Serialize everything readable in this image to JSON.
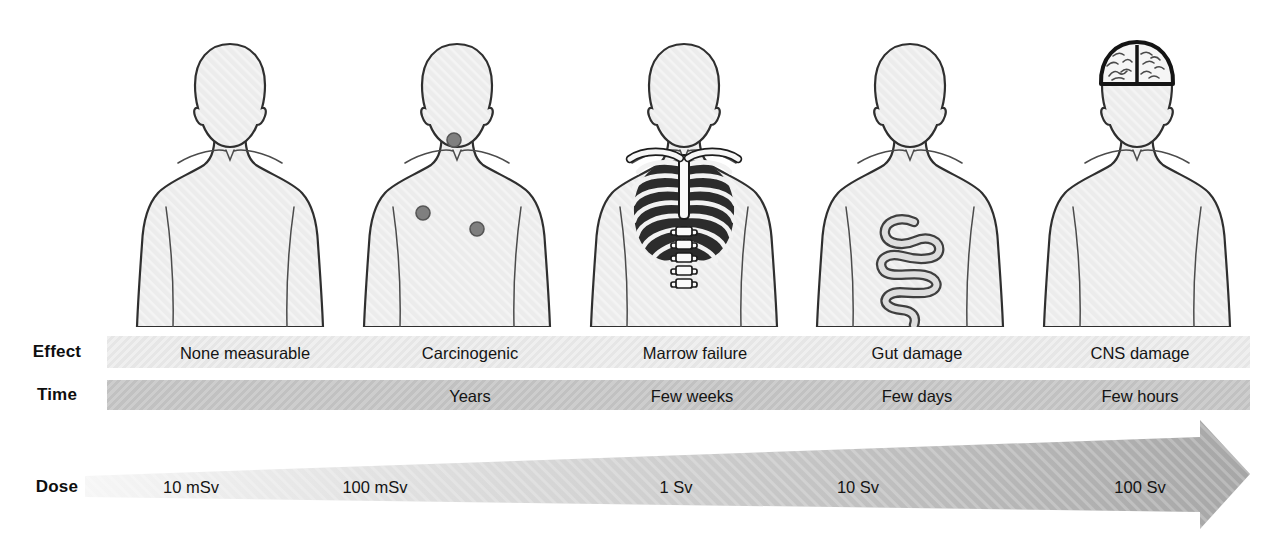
{
  "rows": {
    "effect": {
      "label": "Effect",
      "values": [
        "None measurable",
        "Carcinogenic",
        "Marrow failure",
        "Gut damage",
        "CNS damage"
      ]
    },
    "time": {
      "label": "Time",
      "values": [
        "Years",
        "Few weeks",
        "Few days",
        "Few hours"
      ]
    },
    "dose": {
      "label": "Dose",
      "values": [
        "10 mSv",
        "100 mSv",
        "1 Sv",
        "10 Sv",
        "100 Sv"
      ]
    }
  },
  "figures": [
    {
      "icon": "plain-torso-icon",
      "effect": "None measurable"
    },
    {
      "icon": "tumor-dots-icon",
      "effect": "Carcinogenic"
    },
    {
      "icon": "ribcage-icon",
      "effect": "Marrow failure"
    },
    {
      "icon": "intestine-icon",
      "effect": "Gut damage"
    },
    {
      "icon": "brain-icon",
      "effect": "CNS damage"
    }
  ],
  "colors": {
    "background": "#ffffff",
    "body_fill": "#ececec",
    "body_outline": "#2f2f2f",
    "effect_bar": "#eaeaea",
    "time_bar": "#c7c7c7",
    "dose_arrow_start": "#f4f4f4",
    "dose_arrow_end": "#a6a6a6",
    "tumor_dot": "#7f7f7f"
  }
}
